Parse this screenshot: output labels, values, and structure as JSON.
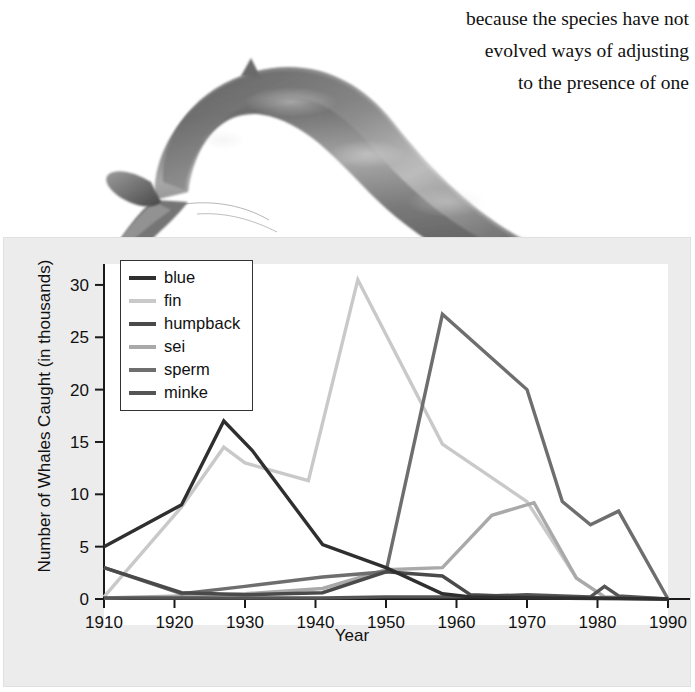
{
  "prose": {
    "line_clipped": "…",
    "lines": [
      "because the species have not",
      "evolved ways of adjusting",
      "to the presence of one"
    ]
  },
  "illustration": {
    "name": "blue-whale-illustration",
    "alt": "Shaded engraving of a diving blue whale"
  },
  "legend": {
    "entries": [
      {
        "label": "blue",
        "color": "#2f2f2f"
      },
      {
        "label": "fin",
        "color": "#c9c9c9"
      },
      {
        "label": "humpback",
        "color": "#4a4a4a"
      },
      {
        "label": "sei",
        "color": "#a9a9a9"
      },
      {
        "label": "sperm",
        "color": "#6e6e6e"
      },
      {
        "label": "minke",
        "color": "#555555"
      }
    ]
  },
  "axes": {
    "x_label": "Year",
    "y_label": "Number of Whales Caught (in thousands)",
    "x_ticks": [
      "1910",
      "1920",
      "1930",
      "1940",
      "1950",
      "1960",
      "1970",
      "1980",
      "1990"
    ],
    "y_ticks": [
      "0",
      "5",
      "10",
      "15",
      "20",
      "25",
      "30"
    ]
  },
  "chart_data": {
    "type": "line",
    "title": "",
    "xlabel": "Year",
    "ylabel": "Number of Whales Caught (in thousands)",
    "xlim": [
      1910,
      1990
    ],
    "ylim": [
      0,
      32
    ],
    "grid": false,
    "legend_position": "upper-left",
    "units": "thousands of whales caught",
    "series": [
      {
        "name": "blue",
        "color": "#2f2f2f",
        "x": [
          1910,
          1921,
          1927,
          1931,
          1941,
          1950,
          1958,
          1962,
          1971,
          1990
        ],
        "y": [
          5.0,
          9.0,
          17.0,
          14.2,
          5.2,
          3.0,
          0.5,
          0.2,
          0.1,
          0.0
        ]
      },
      {
        "name": "fin",
        "color": "#c9c9c9",
        "x": [
          1910,
          1921,
          1927,
          1930,
          1939,
          1946,
          1958,
          1970,
          1977,
          1981,
          1990
        ],
        "y": [
          0.2,
          8.8,
          14.5,
          13.0,
          11.3,
          30.5,
          14.8,
          9.3,
          2.0,
          0.2,
          0.0
        ]
      },
      {
        "name": "humpback",
        "color": "#4a4a4a",
        "x": [
          1910,
          1921,
          1930,
          1941,
          1950,
          1958,
          1962,
          1971,
          1981,
          1990
        ],
        "y": [
          3.0,
          0.6,
          0.4,
          0.6,
          2.6,
          2.2,
          0.4,
          0.2,
          0.1,
          0.0
        ]
      },
      {
        "name": "sei",
        "color": "#a9a9a9",
        "x": [
          1910,
          1921,
          1930,
          1941,
          1950,
          1958,
          1965,
          1971,
          1977,
          1981,
          1990
        ],
        "y": [
          0.1,
          0.3,
          0.5,
          1.0,
          2.8,
          3.0,
          8.0,
          9.2,
          2.0,
          0.2,
          0.0
        ]
      },
      {
        "name": "sperm",
        "color": "#6e6e6e",
        "x": [
          1910,
          1921,
          1930,
          1941,
          1950,
          1958,
          1970,
          1975,
          1979,
          1983,
          1990
        ],
        "y": [
          3.0,
          0.5,
          1.2,
          2.1,
          2.6,
          27.2,
          20.0,
          9.3,
          7.1,
          8.4,
          0.0
        ]
      },
      {
        "name": "minke",
        "color": "#555555",
        "x": [
          1910,
          1930,
          1941,
          1950,
          1960,
          1970,
          1979,
          1981,
          1983,
          1990
        ],
        "y": [
          0.1,
          0.1,
          0.1,
          0.2,
          0.2,
          0.4,
          0.2,
          1.2,
          0.3,
          0.0
        ]
      }
    ]
  }
}
